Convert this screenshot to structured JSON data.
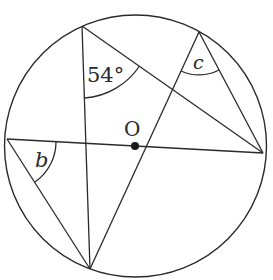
{
  "diagram": {
    "type": "circle-theorem",
    "center_label": "O",
    "angle_labels": {
      "given": "54°",
      "b": "b",
      "c": "c"
    },
    "colors": {
      "stroke": "#2a2a2a",
      "background": "#ffffff"
    }
  }
}
